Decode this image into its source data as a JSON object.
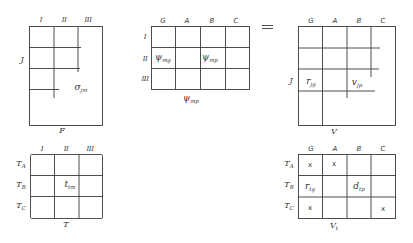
{
  "equals_sign": "=",
  "matrices": {
    "F": {
      "name": "F",
      "columns": [
        "I",
        "II",
        "III"
      ],
      "row_label": "J",
      "cell_label": {
        "sym": "σ",
        "sub": "jm"
      }
    },
    "Psi": {
      "name": {
        "sym": "ψ",
        "sub": "mp"
      },
      "columns": [
        "G",
        "A",
        "B",
        "C"
      ],
      "rows": [
        "I",
        "II",
        "III"
      ],
      "cells": [
        {
          "sym": "ψ",
          "sub": "mg"
        },
        {
          "sym": "ψ",
          "sub": "mp"
        }
      ]
    },
    "V": {
      "name": "V",
      "columns": [
        "G",
        "A",
        "B",
        "C"
      ],
      "row_label": "J",
      "cells": [
        {
          "sym": "r",
          "sub": "jg"
        },
        {
          "sym": "v",
          "sub": "jp"
        }
      ]
    },
    "T": {
      "name": "T",
      "columns": [
        "I",
        "II",
        "III"
      ],
      "rows": [
        {
          "sym": "T",
          "sub": "A"
        },
        {
          "sym": "T",
          "sub": "B"
        },
        {
          "sym": "T",
          "sub": "C"
        }
      ],
      "cell_label": {
        "sym": "t",
        "sub": "tm"
      }
    },
    "Vt": {
      "name": {
        "sym": "V",
        "sub": "t"
      },
      "columns": [
        "G",
        "A",
        "B",
        "C"
      ],
      "rows": [
        {
          "sym": "T",
          "sub": "A"
        },
        {
          "sym": "T",
          "sub": "B"
        },
        {
          "sym": "T",
          "sub": "C"
        }
      ],
      "marks": [
        "x",
        "x",
        "x",
        "x"
      ],
      "cells": [
        {
          "sym": "r",
          "sub": "tg"
        },
        {
          "sym": "d",
          "sub": "tp"
        }
      ]
    }
  }
}
